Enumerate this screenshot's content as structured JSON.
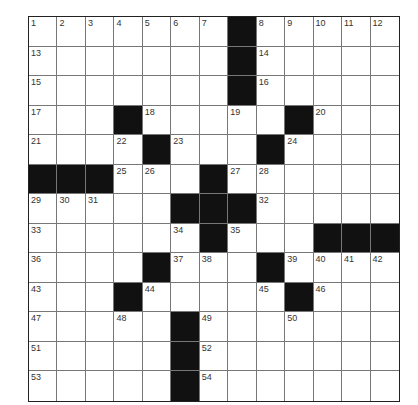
{
  "puzzle": {
    "rows": 13,
    "cols": 13,
    "colors": {
      "block": "#111111",
      "cell": "#ffffff",
      "line": "#777777"
    },
    "grid": [
      [
        "1",
        "2",
        "3",
        "4",
        "5",
        "6",
        "7",
        "#",
        "8",
        "9",
        "10",
        "11",
        "12"
      ],
      [
        "13",
        "",
        "",
        "",
        "",
        "",
        "",
        "#",
        "14",
        "",
        "",
        "",
        ""
      ],
      [
        "15",
        "",
        "",
        "",
        "",
        "",
        "",
        "#",
        "16",
        "",
        "",
        "",
        ""
      ],
      [
        "17",
        "",
        "",
        "#",
        "18",
        "",
        "",
        "19",
        "",
        "#",
        "20",
        "",
        ""
      ],
      [
        "21",
        "",
        "",
        "22",
        "#",
        "23",
        "",
        "",
        "#",
        "24",
        "",
        "",
        ""
      ],
      [
        "#",
        "#",
        "#",
        "25",
        "26",
        "",
        "#",
        "27",
        "28",
        "",
        "",
        "",
        ""
      ],
      [
        "29",
        "30",
        "31",
        "",
        "",
        "#",
        "#",
        "#",
        "32",
        "",
        "",
        "",
        ""
      ],
      [
        "33",
        "",
        "",
        "",
        "",
        "34",
        "#",
        "35",
        "",
        "",
        "#",
        "#",
        "#"
      ],
      [
        "36",
        "",
        "",
        "",
        "#",
        "37",
        "38",
        "",
        "#",
        "39",
        "40",
        "41",
        "42"
      ],
      [
        "43",
        "",
        "",
        "#",
        "44",
        "",
        "",
        "",
        "45",
        "#",
        "46",
        "",
        ""
      ],
      [
        "47",
        "",
        "",
        "48",
        "",
        "#",
        "49",
        "",
        "",
        "50",
        "",
        "",
        ""
      ],
      [
        "51",
        "",
        "",
        "",
        "",
        "#",
        "52",
        "",
        "",
        "",
        "",
        "",
        ""
      ],
      [
        "53",
        "",
        "",
        "",
        "",
        "#",
        "54",
        "",
        "",
        "",
        "",
        "",
        ""
      ]
    ]
  }
}
